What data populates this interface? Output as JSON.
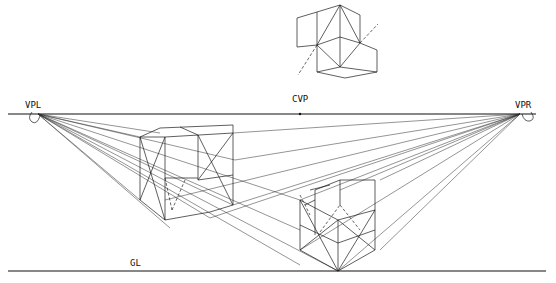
{
  "diagram": {
    "labels": {
      "vanishing_point_left": "VPL",
      "vanishing_point_right": "VPR",
      "center_vision_point": "CVP",
      "ground_line": "GL"
    },
    "elements": [
      "horizon line",
      "ground line",
      "left vanishing point",
      "right vanishing point",
      "center of vision point",
      "floating cube group (top)",
      "left cube group with diagonals",
      "right cube group with diagonals",
      "projection rays to vanishing points"
    ],
    "colors": {
      "ink": "#1a1a1a",
      "paper": "#ffffff"
    }
  }
}
